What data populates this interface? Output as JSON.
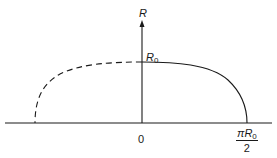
{
  "diagram": {
    "type": "function-plot",
    "axes": {
      "y_label": "R",
      "origin_label": "0"
    },
    "point_labels": {
      "r0_base": "R",
      "r0_sub": "0"
    },
    "x_tick": {
      "numerator_pi": "π",
      "numerator_R": "R",
      "numerator_sub": "0",
      "denominator": "2"
    },
    "curves": [
      {
        "name": "solid-curve",
        "style": "solid",
        "from": "R0 at origin",
        "to": "πR0/2 on axis"
      },
      {
        "name": "dashed-curve",
        "style": "dashed",
        "from": "R0 at origin",
        "to": "negative axis"
      }
    ],
    "colors": {
      "stroke": "#1a1a1a",
      "background": "#ffffff"
    }
  }
}
